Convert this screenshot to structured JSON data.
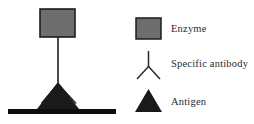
{
  "figure": {
    "background_color": "#ffffff"
  },
  "colors": {
    "enzyme_fill": "#6e6e6e",
    "enzyme_stroke": "#1c1c1c",
    "antigen_fill": "#1a1a1a",
    "antibody_stroke": "#2a2a2a",
    "baseline_fill": "#0d0d0d",
    "text": "#2b2b2b"
  },
  "diagram": {
    "name": "sandwich-assay-diagram",
    "enzyme": {
      "icon": "enzyme-rectangle-icon",
      "fill": "#6e6e6e",
      "x": 40,
      "y": 9,
      "width": 35,
      "height": 28
    },
    "antibody": {
      "icon": "antibody-y-icon",
      "stem_top_y": 37,
      "stem_bottom_y": 84,
      "center_x": 58,
      "arm_left_x": 42,
      "arm_right_x": 76,
      "arm_bottom_y": 103
    },
    "antigen": {
      "icon": "antigen-triangle-icon",
      "fill": "#1a1a1a",
      "apex_x": 58,
      "apex_y": 82,
      "left_x": 37,
      "right_x": 79,
      "base_y": 109
    },
    "surface": {
      "icon": "solid-phase-baseline-icon",
      "x": 8,
      "y": 109,
      "width": 108,
      "height": 5
    }
  },
  "legend": {
    "name": "figure-legend",
    "items": [
      {
        "key": "enzyme",
        "label": "Enzyme",
        "icon": "enzyme-rectangle-icon",
        "swatch_fill": "#6e6e6e"
      },
      {
        "key": "antibody",
        "label": "Specific antibody",
        "icon": "antibody-y-icon",
        "swatch_fill": "none"
      },
      {
        "key": "antigen",
        "label": "Antigen",
        "icon": "antigen-triangle-icon",
        "swatch_fill": "#1a1a1a"
      }
    ]
  }
}
